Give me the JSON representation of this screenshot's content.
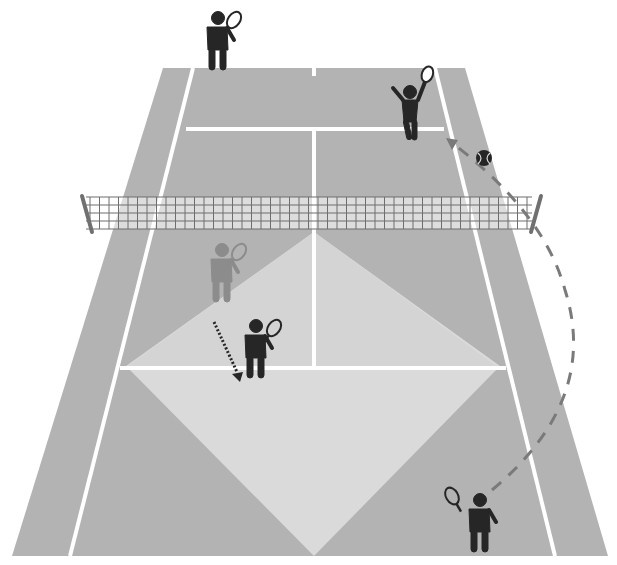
{
  "diagram": {
    "colors": {
      "background": "#ffffff",
      "court": "#b3b3b3",
      "court_light": "#d9d9d9",
      "lines": "#ffffff",
      "net_mesh": "#6e6e6e",
      "net_post": "#707070",
      "player": "#262626",
      "ghost_player": "#8c8c8c",
      "trajectory": "#7a7a7a",
      "ball": "#262626"
    },
    "players": [
      {
        "id": "far-left",
        "role": "opponent baseline",
        "x": 218,
        "y": 45
      },
      {
        "id": "far-right",
        "role": "opponent at net hitting",
        "x": 410,
        "y": 108
      },
      {
        "id": "near-ghost",
        "role": "previous position",
        "x": 222,
        "y": 270
      },
      {
        "id": "near-mid",
        "role": "near partner moved back",
        "x": 258,
        "y": 345
      },
      {
        "id": "near-right",
        "role": "near baseline hitter",
        "x": 480,
        "y": 515
      }
    ],
    "annotations": {
      "movement_arrow": "dotted arrow from ghost player to new position",
      "ball_path": "dashed arc from near-right player over net to far court"
    }
  }
}
